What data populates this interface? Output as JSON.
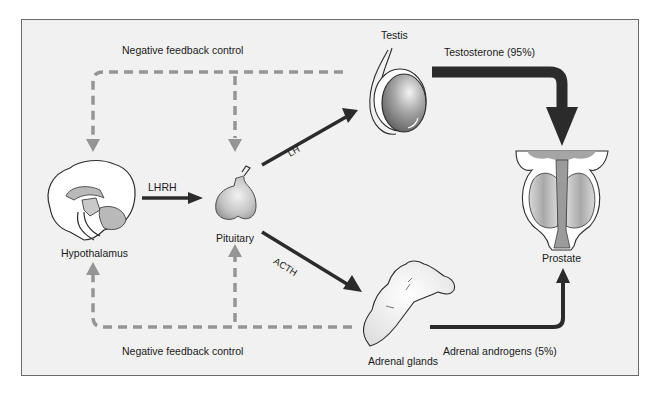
{
  "diagram": {
    "type": "hormone-feedback-flow",
    "colors": {
      "background": "#f1f1f1",
      "frame_border": "#6a6a6a",
      "solid_arrow": "#2b2b2b",
      "feedback_dashed": "#959595",
      "organ_fill": "#bdbdbd"
    },
    "labels": {
      "feedback_top": "Negative feedback control",
      "feedback_bottom": "Negative feedback control",
      "lhrh": "LHRH",
      "lh": "LH",
      "acth": "ACTH",
      "testosterone": "Testosterone (95%)",
      "adrenal_androgens": "Adrenal androgens (5%)"
    },
    "nodes": [
      {
        "id": "hypothalamus",
        "label": "Hypothalamus",
        "icon": "brain-icon"
      },
      {
        "id": "pituitary",
        "label": "Pituitary",
        "icon": "pituitary-icon"
      },
      {
        "id": "testis",
        "label": "Testis",
        "icon": "testis-icon"
      },
      {
        "id": "adrenal",
        "label": "Adrenal glands",
        "icon": "adrenal-gland-icon"
      },
      {
        "id": "prostate",
        "label": "Prostate",
        "icon": "prostate-icon"
      }
    ],
    "edges": [
      {
        "from": "hypothalamus",
        "to": "pituitary",
        "label": "LHRH",
        "style": "solid"
      },
      {
        "from": "pituitary",
        "to": "testis",
        "label": "LH",
        "style": "solid"
      },
      {
        "from": "pituitary",
        "to": "adrenal",
        "label": "ACTH",
        "style": "solid"
      },
      {
        "from": "testis",
        "to": "prostate",
        "label": "Testosterone (95%)",
        "style": "thick-solid"
      },
      {
        "from": "adrenal",
        "to": "prostate",
        "label": "Adrenal androgens (5%)",
        "style": "solid"
      },
      {
        "from": "testis",
        "to": [
          "hypothalamus",
          "pituitary"
        ],
        "label": "Negative feedback control",
        "style": "dashed"
      },
      {
        "from": "adrenal",
        "to": [
          "hypothalamus",
          "pituitary"
        ],
        "label": "Negative feedback control",
        "style": "dashed"
      }
    ]
  }
}
